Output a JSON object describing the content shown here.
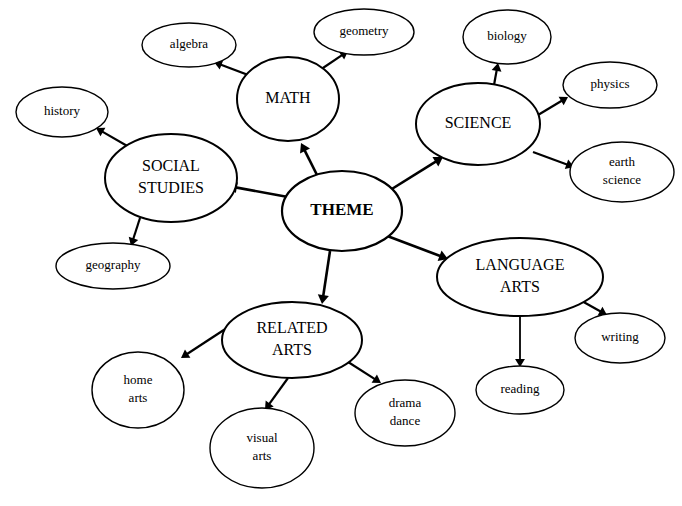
{
  "diagram": {
    "type": "mind-map",
    "canvas": {
      "width": 682,
      "height": 506,
      "background": "#ffffff"
    },
    "stroke_color": "#000000",
    "text_color": "#000000",
    "nodes": [
      {
        "id": "theme",
        "lines": [
          "THEME"
        ],
        "cx": 342,
        "cy": 211,
        "rx": 60,
        "ry": 40,
        "font_size": 17,
        "font_weight": "bold",
        "line_height": 20,
        "stroke_width": 2.2,
        "level": "root"
      },
      {
        "id": "math",
        "lines": [
          "MATH"
        ],
        "cx": 288,
        "cy": 99,
        "rx": 51,
        "ry": 42,
        "font_size": 16,
        "font_weight": "normal",
        "line_height": 19,
        "stroke_width": 2.0,
        "level": "branch"
      },
      {
        "id": "social-studies",
        "lines": [
          "SOCIAL",
          "STUDIES"
        ],
        "cx": 171,
        "cy": 178,
        "rx": 66,
        "ry": 44,
        "font_size": 16,
        "font_weight": "normal",
        "line_height": 22,
        "stroke_width": 2.0,
        "level": "branch"
      },
      {
        "id": "science",
        "lines": [
          "SCIENCE"
        ],
        "cx": 478,
        "cy": 124,
        "rx": 62,
        "ry": 41,
        "font_size": 16,
        "font_weight": "normal",
        "line_height": 19,
        "stroke_width": 2.0,
        "level": "branch"
      },
      {
        "id": "language-arts",
        "lines": [
          "LANGUAGE",
          "ARTS"
        ],
        "cx": 520,
        "cy": 277,
        "rx": 83,
        "ry": 39,
        "font_size": 16,
        "font_weight": "normal",
        "line_height": 22,
        "stroke_width": 2.0,
        "level": "branch"
      },
      {
        "id": "related-arts",
        "lines": [
          "RELATED",
          "ARTS"
        ],
        "cx": 292,
        "cy": 340,
        "rx": 70,
        "ry": 38,
        "font_size": 16,
        "font_weight": "normal",
        "line_height": 22,
        "stroke_width": 2.0,
        "level": "branch"
      },
      {
        "id": "algebra",
        "lines": [
          "algebra"
        ],
        "cx": 189,
        "cy": 45,
        "rx": 47,
        "ry": 22,
        "font_size": 13,
        "font_weight": "normal",
        "line_height": 16,
        "stroke_width": 1.4,
        "level": "leaf"
      },
      {
        "id": "geometry",
        "lines": [
          "geometry"
        ],
        "cx": 364,
        "cy": 32,
        "rx": 50,
        "ry": 23,
        "font_size": 13,
        "font_weight": "normal",
        "line_height": 16,
        "stroke_width": 1.4,
        "level": "leaf"
      },
      {
        "id": "history",
        "lines": [
          "history"
        ],
        "cx": 62,
        "cy": 112,
        "rx": 46,
        "ry": 25,
        "font_size": 13,
        "font_weight": "normal",
        "line_height": 16,
        "stroke_width": 1.4,
        "level": "leaf"
      },
      {
        "id": "geography",
        "lines": [
          "geography"
        ],
        "cx": 113,
        "cy": 266,
        "rx": 57,
        "ry": 23,
        "font_size": 13,
        "font_weight": "normal",
        "line_height": 16,
        "stroke_width": 1.4,
        "level": "leaf"
      },
      {
        "id": "biology",
        "lines": [
          "biology"
        ],
        "cx": 507,
        "cy": 37,
        "rx": 44,
        "ry": 27,
        "font_size": 13,
        "font_weight": "normal",
        "line_height": 16,
        "stroke_width": 1.4,
        "level": "leaf"
      },
      {
        "id": "physics",
        "lines": [
          "physics"
        ],
        "cx": 610,
        "cy": 85,
        "rx": 47,
        "ry": 23,
        "font_size": 13,
        "font_weight": "normal",
        "line_height": 16,
        "stroke_width": 1.4,
        "level": "leaf"
      },
      {
        "id": "earth-science",
        "lines": [
          "earth",
          "science"
        ],
        "cx": 622,
        "cy": 172,
        "rx": 52,
        "ry": 30,
        "font_size": 13,
        "font_weight": "normal",
        "line_height": 18,
        "stroke_width": 1.4,
        "level": "leaf"
      },
      {
        "id": "writing",
        "lines": [
          "writing"
        ],
        "cx": 620,
        "cy": 338,
        "rx": 45,
        "ry": 25,
        "font_size": 13,
        "font_weight": "normal",
        "line_height": 16,
        "stroke_width": 1.4,
        "level": "leaf"
      },
      {
        "id": "reading",
        "lines": [
          "reading"
        ],
        "cx": 520,
        "cy": 390,
        "rx": 44,
        "ry": 24,
        "font_size": 13,
        "font_weight": "normal",
        "line_height": 16,
        "stroke_width": 1.4,
        "level": "leaf"
      },
      {
        "id": "home-arts",
        "lines": [
          "home",
          "arts"
        ],
        "cx": 138,
        "cy": 390,
        "rx": 46,
        "ry": 38,
        "font_size": 13,
        "font_weight": "normal",
        "line_height": 18,
        "stroke_width": 1.4,
        "level": "leaf"
      },
      {
        "id": "visual-arts",
        "lines": [
          "visual",
          "arts"
        ],
        "cx": 262,
        "cy": 448,
        "rx": 52,
        "ry": 40,
        "font_size": 13,
        "font_weight": "normal",
        "line_height": 18,
        "stroke_width": 1.4,
        "level": "leaf"
      },
      {
        "id": "drama-dance",
        "lines": [
          "drama",
          "dance"
        ],
        "cx": 405,
        "cy": 413,
        "rx": 50,
        "ry": 33,
        "font_size": 13,
        "font_weight": "normal",
        "line_height": 18,
        "stroke_width": 1.4,
        "level": "leaf"
      }
    ],
    "edges": [
      {
        "id": "theme-to-math",
        "from": "theme",
        "to": "math",
        "x1": 320,
        "y1": 181,
        "x2": 301,
        "y2": 143,
        "stroke_width": 2.6,
        "head": 9
      },
      {
        "id": "theme-to-social-studies",
        "from": "theme",
        "to": "social-studies",
        "x1": 288,
        "y1": 197,
        "x2": 228,
        "y2": 186,
        "stroke_width": 2.6,
        "head": 9
      },
      {
        "id": "theme-to-science",
        "from": "theme",
        "to": "science",
        "x1": 387,
        "y1": 192,
        "x2": 443,
        "y2": 157,
        "stroke_width": 2.6,
        "head": 9
      },
      {
        "id": "theme-to-language-arts",
        "from": "theme",
        "to": "language-arts",
        "x1": 382,
        "y1": 234,
        "x2": 448,
        "y2": 259,
        "stroke_width": 2.6,
        "head": 9
      },
      {
        "id": "theme-to-related-arts",
        "from": "theme",
        "to": "related-arts",
        "x1": 330,
        "y1": 251,
        "x2": 322,
        "y2": 304,
        "stroke_width": 2.6,
        "head": 9
      },
      {
        "id": "math-to-algebra",
        "from": "math",
        "to": "algebra",
        "x1": 256,
        "y1": 78,
        "x2": 214,
        "y2": 62,
        "stroke_width": 2.2,
        "head": 8
      },
      {
        "id": "math-to-geometry",
        "from": "math",
        "to": "geometry",
        "x1": 317,
        "y1": 72,
        "x2": 348,
        "y2": 51,
        "stroke_width": 2.2,
        "head": 8
      },
      {
        "id": "social-studies-to-history",
        "from": "social-studies",
        "to": "history",
        "x1": 129,
        "y1": 147,
        "x2": 96,
        "y2": 128,
        "stroke_width": 2.2,
        "head": 8
      },
      {
        "id": "social-studies-to-geography",
        "from": "social-studies",
        "to": "geography",
        "x1": 140,
        "y1": 218,
        "x2": 131,
        "y2": 246,
        "stroke_width": 2.2,
        "head": 8
      },
      {
        "id": "science-to-biology",
        "from": "science",
        "to": "biology",
        "x1": 494,
        "y1": 85,
        "x2": 498,
        "y2": 63,
        "stroke_width": 2.2,
        "head": 8
      },
      {
        "id": "science-to-physics",
        "from": "science",
        "to": "physics",
        "x1": 538,
        "y1": 115,
        "x2": 568,
        "y2": 97,
        "stroke_width": 2.2,
        "head": 8
      },
      {
        "id": "science-to-earth-science",
        "from": "science",
        "to": "earth-science",
        "x1": 533,
        "y1": 152,
        "x2": 574,
        "y2": 167,
        "stroke_width": 2.2,
        "head": 8
      },
      {
        "id": "language-arts-to-writing",
        "from": "language-arts",
        "to": "writing",
        "x1": 580,
        "y1": 300,
        "x2": 607,
        "y2": 315,
        "stroke_width": 2.2,
        "head": 8
      },
      {
        "id": "language-arts-to-reading",
        "from": "language-arts",
        "to": "reading",
        "x1": 520,
        "y1": 316,
        "x2": 520,
        "y2": 367,
        "stroke_width": 1.8,
        "head": 8
      },
      {
        "id": "related-arts-to-home-arts",
        "from": "related-arts",
        "to": "home-arts",
        "x1": 236,
        "y1": 322,
        "x2": 181,
        "y2": 358,
        "stroke_width": 2.2,
        "head": 8
      },
      {
        "id": "related-arts-to-visual-arts",
        "from": "related-arts",
        "to": "visual-arts",
        "x1": 288,
        "y1": 378,
        "x2": 265,
        "y2": 410,
        "stroke_width": 2.2,
        "head": 8
      },
      {
        "id": "related-arts-to-drama-dance",
        "from": "related-arts",
        "to": "drama-dance",
        "x1": 345,
        "y1": 360,
        "x2": 381,
        "y2": 383,
        "stroke_width": 2.2,
        "head": 8
      }
    ]
  }
}
